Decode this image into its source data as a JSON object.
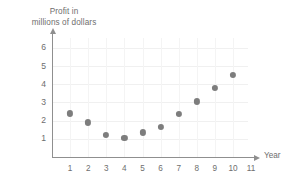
{
  "chart_data": {
    "type": "scatter",
    "title": "",
    "ylabel_lines": [
      "Profit in",
      "millions of dollars"
    ],
    "ylabel": "Profit in millions of dollars",
    "xlabel": "Year",
    "x": [
      1,
      2,
      3,
      4,
      5,
      6,
      7,
      8,
      9,
      10
    ],
    "values": [
      2.4,
      1.9,
      1.2,
      1.05,
      1.35,
      1.65,
      2.35,
      3.05,
      3.8,
      4.5
    ],
    "points": [
      {
        "x": 1,
        "y": 2.4
      },
      {
        "x": 2,
        "y": 1.9
      },
      {
        "x": 3,
        "y": 1.2
      },
      {
        "x": 4,
        "y": 1.05
      },
      {
        "x": 5,
        "y": 1.35
      },
      {
        "x": 6,
        "y": 1.65
      },
      {
        "x": 7,
        "y": 2.35
      },
      {
        "x": 8,
        "y": 3.05
      },
      {
        "x": 9,
        "y": 3.8
      },
      {
        "x": 10,
        "y": 4.5
      }
    ],
    "xtick_labels": [
      "1",
      "2",
      "3",
      "4",
      "5",
      "6",
      "7",
      "8",
      "9",
      "10",
      "11"
    ],
    "ytick_labels": [
      "1",
      "2",
      "3",
      "4",
      "5",
      "6"
    ],
    "xlim": [
      0,
      11.6
    ],
    "ylim": [
      0,
      6.55
    ],
    "grid": true,
    "legend": null,
    "marker_color": "#7d7d7d",
    "axis_color": "#8f8f8f",
    "text_color": "#6e6e6e",
    "background_color": "#ffffff"
  }
}
